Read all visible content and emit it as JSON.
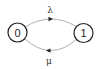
{
  "diagram": {
    "type": "state-transition",
    "states": [
      {
        "id": "0",
        "label": "0"
      },
      {
        "id": "1",
        "label": "1"
      }
    ],
    "transitions": [
      {
        "from": "0",
        "to": "1",
        "label": "λ",
        "position": "top"
      },
      {
        "from": "1",
        "to": "0",
        "label": "μ",
        "position": "bottom"
      }
    ]
  },
  "colors": {
    "node_stroke": "#222222",
    "edge_stroke": "#b0b0b0",
    "arrow_fill": "#222222",
    "background": "#ffffff"
  }
}
